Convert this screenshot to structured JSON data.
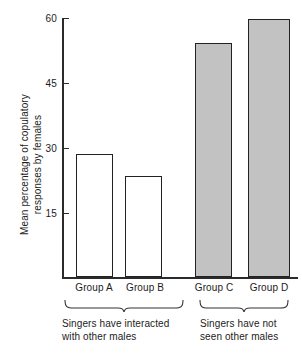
{
  "chart_data": {
    "type": "bar",
    "title": "",
    "subtitle": "",
    "xlabel": "",
    "ylabel": "Mean percentage of copulatory\nresponses by females",
    "categories": [
      "Group A",
      "Group B",
      "Group C",
      "Group D"
    ],
    "values": [
      28.7,
      23.6,
      54.6,
      60.0
    ],
    "series": [
      {
        "name": "Mean percentage of copulatory responses by females",
        "values": [
          28.7,
          23.6,
          54.6,
          60.0
        ]
      }
    ],
    "ylim": [
      0,
      60
    ],
    "yticks": [
      15,
      30,
      45,
      60
    ],
    "ytick_labels": [
      "15",
      "30",
      "45",
      "60"
    ],
    "grid": false,
    "legend": null,
    "legend_position": "none",
    "bar_styles": [
      "open",
      "open",
      "filled",
      "filled"
    ],
    "colors": {
      "open_fill": "#ffffff",
      "filled_fill": "#c2c2c2",
      "bar_outline": "#222222",
      "axis": "#2b2b2b",
      "text": "#1c1c1c"
    },
    "annotations": [
      {
        "name": "group-bracket-left",
        "covers": [
          "Group A",
          "Group B"
        ],
        "text": "Singers have interacted\nwith other males"
      },
      {
        "name": "group-bracket-right",
        "covers": [
          "Group C",
          "Group D"
        ],
        "text": "Singers have not\nseen other males"
      }
    ]
  },
  "axis": {
    "ytitle": "Mean percentage of copulatory\nresponses by females",
    "ticks": [
      {
        "label": "60",
        "value": 60
      },
      {
        "label": "45",
        "value": 45
      },
      {
        "label": "30",
        "value": 30
      },
      {
        "label": "15",
        "value": 15
      }
    ]
  },
  "bars": [
    {
      "label": "Group A",
      "value": 28.7,
      "style": "open"
    },
    {
      "label": "Group B",
      "value": 23.6,
      "style": "open"
    },
    {
      "label": "Group C",
      "value": 54.6,
      "style": "filled"
    },
    {
      "label": "Group D",
      "value": 60.0,
      "style": "filled"
    }
  ],
  "captions": {
    "left": "Singers have interacted\nwith other males",
    "right": "Singers have not\nseen other males"
  }
}
